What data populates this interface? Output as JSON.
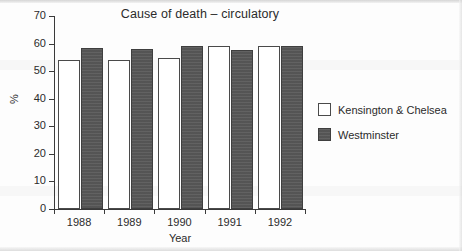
{
  "chart_data": {
    "type": "bar",
    "title": "Cause of death – circulatory",
    "xlabel": "Year",
    "ylabel": "%",
    "categories": [
      "1988",
      "1989",
      "1990",
      "1991",
      "1992"
    ],
    "series": [
      {
        "name": "Kensington & Chelsea",
        "color": "#ffffff",
        "values": [
          54.2,
          54.2,
          54.7,
          59.1,
          59.3
        ]
      },
      {
        "name": "Westminster",
        "color": "#595959",
        "values": [
          58.4,
          58.1,
          59.0,
          57.7,
          59.3
        ]
      }
    ],
    "ylim": [
      0,
      70
    ],
    "yticks": [
      0,
      10,
      20,
      30,
      40,
      50,
      60,
      70
    ],
    "ytick_labels": [
      "0",
      "10",
      "20",
      "30",
      "40",
      "50",
      "60",
      "70"
    ],
    "grid": false,
    "legend_position": "right"
  },
  "legend": {
    "entries": [
      {
        "label": "Kensington & Chelsea",
        "swatch": "light"
      },
      {
        "label": "Westminster",
        "swatch": "dark"
      }
    ]
  }
}
